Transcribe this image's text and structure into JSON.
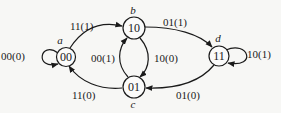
{
  "diagram": {
    "type": "state-transition-diagram",
    "nodes": [
      {
        "id": "a",
        "name": "a",
        "state": "00"
      },
      {
        "id": "b",
        "name": "b",
        "state": "10"
      },
      {
        "id": "c",
        "name": "c",
        "state": "01"
      },
      {
        "id": "d",
        "name": "d",
        "state": "11"
      }
    ],
    "edges": [
      {
        "from": "a",
        "to": "a",
        "label": "00(0)"
      },
      {
        "from": "a",
        "to": "b",
        "label": "11(1)"
      },
      {
        "from": "b",
        "to": "d",
        "label": "01(1)"
      },
      {
        "from": "b",
        "to": "c",
        "label": "10(0)"
      },
      {
        "from": "c",
        "to": "b",
        "label": "00(1)"
      },
      {
        "from": "c",
        "to": "a",
        "label": "11(0)"
      },
      {
        "from": "d",
        "to": "c",
        "label": "01(0)"
      },
      {
        "from": "d",
        "to": "d",
        "label": "10(1)"
      }
    ]
  }
}
